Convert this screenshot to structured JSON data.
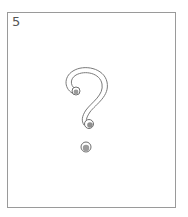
{
  "card": {
    "number": "5",
    "symbol": "question-mark",
    "border_color": "#9a9a9a",
    "stroke_color": "#707070"
  }
}
